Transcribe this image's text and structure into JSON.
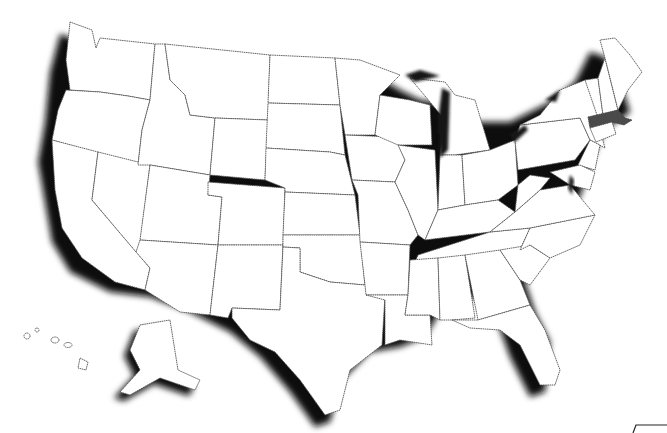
{
  "map": {
    "title": "",
    "region": "United States",
    "style": "outline map with drop shadow",
    "highlighted_states": [
      {
        "name": "Massachusetts",
        "color": "#4a4a4a"
      }
    ],
    "colors": {
      "background": "#ffffff",
      "land": "#ffffff",
      "border": "#555555",
      "shadow": "#111111",
      "highlight": "#4a4a4a"
    },
    "insets": [
      "Alaska",
      "Hawaii"
    ]
  }
}
